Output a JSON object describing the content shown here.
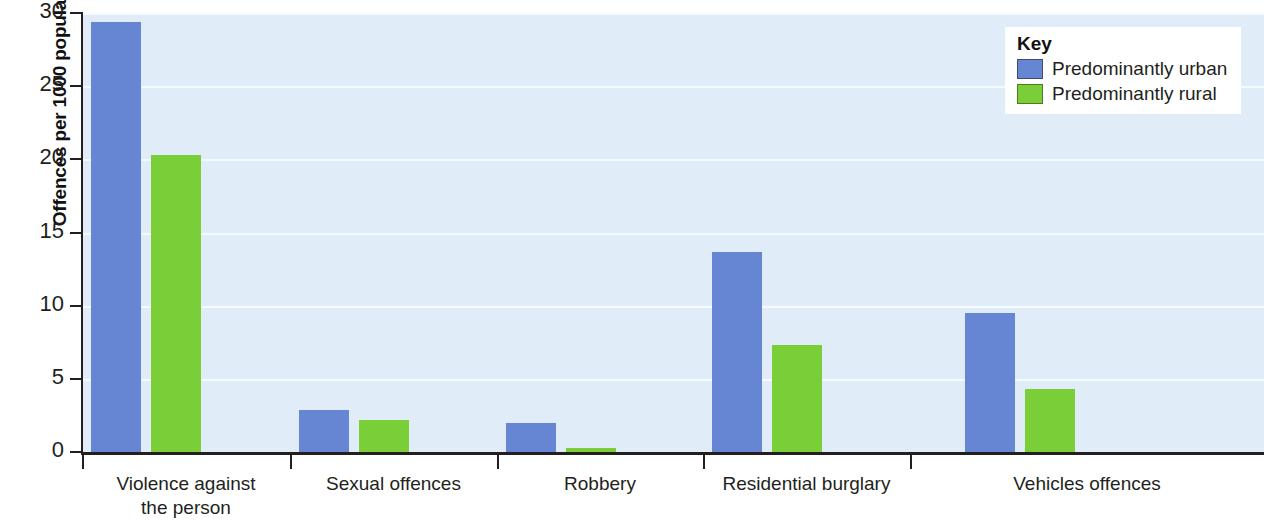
{
  "chart_data": {
    "type": "bar",
    "title": "",
    "xlabel": "",
    "ylabel": "Offences per 1000 population",
    "ylim": [
      0,
      30
    ],
    "ytick_labels": [
      "30",
      "25",
      "20",
      "15",
      "10",
      "5",
      "0"
    ],
    "ytick_values": [
      30,
      25,
      20,
      15,
      10,
      5,
      0
    ],
    "grid": true,
    "legend_position": "top-right",
    "categories": [
      "Violence against the person",
      "Sexual offences",
      "Robbery",
      "Residential burglary",
      "Vehicles offences"
    ],
    "category_lines": [
      [
        "Violence against",
        "the person"
      ],
      [
        "Sexual offences"
      ],
      [
        "Robbery"
      ],
      [
        "Residential burglary"
      ],
      [
        "Vehicles offences"
      ]
    ],
    "series": [
      {
        "name": "Predominantly urban",
        "color": "#6686d4",
        "values": [
          29.4,
          2.9,
          2.0,
          13.7,
          9.5
        ]
      },
      {
        "name": "Predominantly rural",
        "color": "#7ace38",
        "values": [
          20.3,
          2.2,
          0.3,
          7.3,
          4.3
        ]
      }
    ]
  },
  "legend": {
    "title": "Key",
    "entries": [
      {
        "label": "Predominantly urban",
        "color": "#6686d4"
      },
      {
        "label": "Predominantly rural",
        "color": "#7ace38"
      }
    ]
  },
  "colors": {
    "urban": "#6686d4",
    "rural": "#7ace38",
    "plot_background": "#e0ecf7",
    "gridline": "#f4fafd",
    "axis": "#231f20"
  }
}
